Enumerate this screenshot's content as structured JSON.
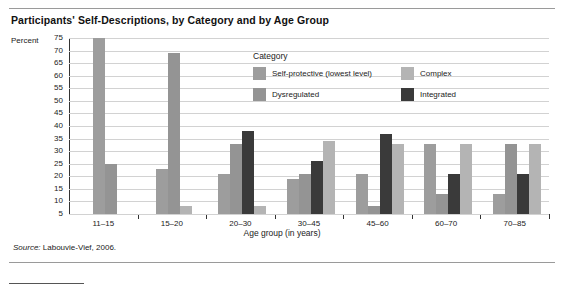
{
  "figure": {
    "title": "Participants' Self-Descriptions, by Category and by Age Group",
    "percent_axis_label": "Percent",
    "source_prefix": "Source:",
    "source_text": "Labouvie-Vief, 2006."
  },
  "chart_data": {
    "type": "bar",
    "title": "Participants' Self-Descriptions, by Category and by Age Group",
    "xlabel": "Age group (in years)",
    "ylabel": "Percent",
    "ylim": [
      5,
      75
    ],
    "yticks": [
      75,
      70,
      65,
      60,
      55,
      50,
      45,
      40,
      35,
      30,
      25,
      20,
      15,
      10,
      5
    ],
    "grid": true,
    "legend_title": "Category",
    "legend_position": "inside-top-center",
    "categories": [
      "11–15",
      "15–20",
      "20–30",
      "30–45",
      "45–60",
      "60–70",
      "70–85"
    ],
    "series": [
      {
        "name": "Self-protective (lowest level)",
        "color": "#9d9d9d",
        "values": [
          75,
          23,
          21,
          19,
          21,
          33,
          13
        ]
      },
      {
        "name": "Dysregulated",
        "color": "#949494",
        "values": [
          25,
          69,
          33,
          21,
          8,
          13,
          33
        ]
      },
      {
        "name": "Complex",
        "color": "#b4b4b4",
        "values": [
          null,
          8,
          8,
          34,
          33,
          33,
          33
        ]
      },
      {
        "name": "Integrated",
        "color": "#3a3a3a",
        "values": [
          null,
          null,
          38,
          26,
          37,
          21,
          21
        ]
      }
    ],
    "bar_order_per_group": [
      [
        "Self-protective (lowest level)",
        "Dysregulated"
      ],
      [
        "Self-protective (lowest level)",
        "Dysregulated",
        "Complex"
      ],
      [
        "Self-protective (lowest level)",
        "Dysregulated",
        "Integrated",
        "Complex"
      ],
      [
        "Self-protective (lowest level)",
        "Dysregulated",
        "Integrated",
        "Complex"
      ],
      [
        "Self-protective (lowest level)",
        "Dysregulated",
        "Integrated",
        "Complex"
      ],
      [
        "Self-protective (lowest level)",
        "Dysregulated",
        "Integrated",
        "Complex"
      ],
      [
        "Self-protective (lowest level)",
        "Dysregulated",
        "Integrated",
        "Complex"
      ]
    ]
  },
  "legend": {
    "title": "Category",
    "items": [
      {
        "label": "Self-protective (lowest level)",
        "color": "#9d9d9d"
      },
      {
        "label": "Dysregulated",
        "color": "#949494"
      },
      {
        "label": "Complex",
        "color": "#b4b4b4"
      },
      {
        "label": "Integrated",
        "color": "#3a3a3a"
      }
    ]
  }
}
